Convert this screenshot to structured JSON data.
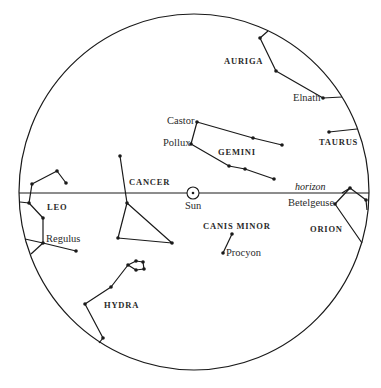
{
  "diagram": {
    "type": "star_chart",
    "colors": {
      "ink": "#1a1a1a",
      "background": "#ffffff"
    },
    "sky_circle": {
      "cx": 194,
      "cy": 192,
      "rx": 175,
      "ry": 178
    },
    "horizon": {
      "label": "horizon",
      "y": 193,
      "x1": 19,
      "x2": 369
    },
    "sun": {
      "label": "Sun",
      "x": 193,
      "y": 193,
      "r": 6
    },
    "constellations": [
      {
        "name": "AURIGA",
        "label_pos": [
          224,
          57
        ],
        "lines": [
          [
            [
              268,
              31
            ],
            [
              260,
              38
            ],
            [
              276,
              71
            ],
            [
              323,
              98
            ],
            [
              342,
              97
            ]
          ]
        ]
      },
      {
        "name": "TAURUS",
        "label_pos": [
          319,
          138
        ],
        "lines": [
          [
            [
              329,
              132
            ],
            [
              357,
              129
            ]
          ]
        ]
      },
      {
        "name": "GEMINI",
        "label_pos": [
          218,
          148
        ],
        "lines": [
          [
            [
              282,
              145
            ],
            [
              253,
              138
            ],
            [
              197,
              122
            ],
            [
              191,
              144
            ],
            [
              229,
              166
            ],
            [
              245,
              169
            ],
            [
              274,
              179
            ]
          ]
        ]
      },
      {
        "name": "CANCER",
        "label_pos": [
          129,
          178
        ],
        "lines": [
          [
            [
              120,
              156
            ],
            [
              127,
              203
            ]
          ],
          [
            [
              127,
              203
            ],
            [
              118,
              238
            ],
            [
              172,
              243
            ],
            [
              127,
              203
            ]
          ]
        ]
      },
      {
        "name": "LEO",
        "label_pos": [
          47,
          203
        ],
        "lines": [
          [
            [
              66,
              183
            ],
            [
              57,
              171
            ],
            [
              32,
              184
            ],
            [
              29,
              203
            ],
            [
              43,
              218
            ],
            [
              43,
              243
            ],
            [
              76,
              251
            ]
          ],
          [
            [
              29,
              203
            ],
            [
              20,
              202
            ]
          ],
          [
            [
              43,
              243
            ],
            [
              25,
              239
            ]
          ],
          [
            [
              43,
              243
            ],
            [
              31,
              254
            ]
          ]
        ]
      },
      {
        "name": "HYDRA",
        "label_pos": [
          104,
          301
        ],
        "lines": [
          [
            [
              99,
              343
            ],
            [
              103,
              338
            ],
            [
              85,
              304
            ],
            [
              111,
              287
            ],
            [
              128,
              265
            ],
            [
              136,
              261
            ],
            [
              143,
              262
            ],
            [
              144,
              269
            ],
            [
              136,
              270
            ],
            [
              128,
              265
            ]
          ]
        ]
      },
      {
        "name": "CANIS MINOR",
        "label_pos": [
          203,
          222
        ],
        "lines": [
          [
            [
              232,
              234
            ],
            [
              223,
              253
            ]
          ]
        ]
      },
      {
        "name": "ORION",
        "label_pos": [
          310,
          225
        ],
        "lines": [
          [
            [
              342,
              193
            ],
            [
              350,
              188
            ],
            [
              366,
              200
            ],
            [
              367,
              210
            ]
          ],
          [
            [
              350,
              188
            ],
            [
              335,
              204
            ],
            [
              362,
              243
            ]
          ]
        ]
      }
    ],
    "stars": [
      {
        "name": "Castor",
        "x": 197,
        "y": 122,
        "label_pos": [
          167,
          116
        ]
      },
      {
        "name": "Pollux",
        "x": 191,
        "y": 144,
        "label_pos": [
          163,
          138
        ]
      },
      {
        "name": "Elnath",
        "x": 323,
        "y": 98,
        "label_pos": [
          293,
          93
        ]
      },
      {
        "name": "Betelgeuse",
        "x": 335,
        "y": 204,
        "label_pos": [
          288,
          198
        ]
      },
      {
        "name": "Regulus",
        "x": 43,
        "y": 243,
        "label_pos": [
          46,
          234
        ]
      },
      {
        "name": "Procyon",
        "x": 223,
        "y": 253,
        "label_pos": [
          226,
          248
        ]
      }
    ],
    "dots": [
      [
        260,
        38
      ],
      [
        276,
        71
      ],
      [
        323,
        98
      ],
      [
        329,
        132
      ],
      [
        197,
        122
      ],
      [
        253,
        138
      ],
      [
        282,
        145
      ],
      [
        191,
        144
      ],
      [
        229,
        166
      ],
      [
        245,
        169
      ],
      [
        274,
        179
      ],
      [
        120,
        156
      ],
      [
        127,
        203
      ],
      [
        118,
        238
      ],
      [
        172,
        243
      ],
      [
        32,
        184
      ],
      [
        57,
        171
      ],
      [
        66,
        183
      ],
      [
        29,
        203
      ],
      [
        43,
        218
      ],
      [
        43,
        243
      ],
      [
        76,
        251
      ],
      [
        128,
        265
      ],
      [
        136,
        261
      ],
      [
        143,
        262
      ],
      [
        144,
        269
      ],
      [
        136,
        270
      ],
      [
        111,
        287
      ],
      [
        85,
        304
      ],
      [
        103,
        338
      ],
      [
        232,
        234
      ],
      [
        223,
        253
      ],
      [
        350,
        188
      ],
      [
        366,
        200
      ],
      [
        335,
        204
      ]
    ]
  }
}
